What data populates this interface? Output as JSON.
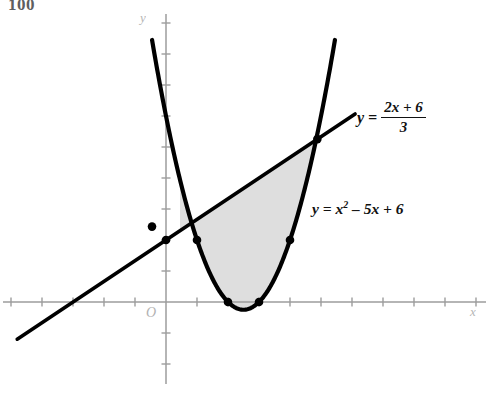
{
  "page": {
    "number": "100",
    "background": "#ffffff"
  },
  "labels": {
    "line_equation_lhs": "y =",
    "line_equation_numerator": "2x + 6",
    "line_equation_denominator": "3",
    "parabola_equation": "y = x",
    "parabola_exponent": "2",
    "parabola_equation_rest": " – 5x + 6",
    "x_axis_name": "x",
    "y_axis_name": "y",
    "origin": "O"
  },
  "style": {
    "curve_color": "#000000",
    "axis_color": "#9c9c9c",
    "shade_color": "#dcdcdc",
    "point_color": "#000000"
  },
  "chart_data": {
    "type": "line",
    "title": "",
    "xlabel": "x",
    "ylabel": "y",
    "grid": false,
    "legend": "inline-annotations",
    "xlim": [
      -5.4,
      10.6
    ],
    "ylim": [
      -3.2,
      9.4
    ],
    "x_tick_interval": 1,
    "y_tick_interval": 1,
    "origin_label": "O",
    "series": [
      {
        "name": "y = x^2 - 5x + 6",
        "type": "parabola",
        "equation": "y = x^2 - 5x + 6",
        "coefficients": {
          "a": 1,
          "b": -5,
          "c": 6
        },
        "vertex": [
          2.5,
          -0.25
        ],
        "roots": [
          2,
          3
        ],
        "y_intercept": 6,
        "drawn_x_range": [
          -0.45,
          5.45
        ]
      },
      {
        "name": "y = (2x + 6)/3",
        "type": "line",
        "equation": "y = (2x + 6)/3",
        "slope": 0.6667,
        "intercept": 2,
        "x_intercept": -3,
        "y_intercept": 2,
        "drawn_x_range": [
          -4.8,
          6.1
        ]
      }
    ],
    "shaded_region": {
      "label": "region between line and parabola",
      "fill": "#dcdcdc",
      "x_range": [
        0.4514,
        4.8819
      ],
      "bounded_above_by": "y = (2x + 6)/3",
      "bounded_below_by": "y = x^2 - 5x + 6"
    },
    "marked_points": [
      {
        "x": -0.4514,
        "y": 2.4324,
        "note": "left intersection of line and parabola"
      },
      {
        "x": 4.8819,
        "y": 5.2546,
        "note": "right intersection of line and parabola"
      },
      {
        "x": 0,
        "y": 2,
        "note": "line y-intercept"
      },
      {
        "x": 1,
        "y": 2,
        "note": "parabola at x = 1"
      },
      {
        "x": 4,
        "y": 2,
        "note": "parabola at x = 4"
      },
      {
        "x": 2,
        "y": 0,
        "note": "parabola root"
      },
      {
        "x": 3,
        "y": 0,
        "note": "parabola root"
      }
    ]
  }
}
